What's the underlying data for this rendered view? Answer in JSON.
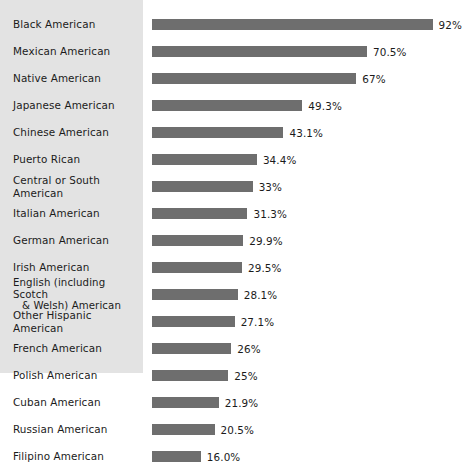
{
  "chart": {
    "type": "bar",
    "orientation": "horizontal",
    "title": "",
    "subtitle": "",
    "xlabel": "",
    "ylabel": "",
    "legend": "none",
    "grid": false,
    "axis_visible": false,
    "bar_color": "#6e6e6e",
    "label_panel_color": "#e3e3e3",
    "text_color": "#1b1b1b",
    "background_color": "#ffffff"
  },
  "chart_data": {
    "type": "bar",
    "orientation": "horizontal",
    "title": "",
    "subtitle": "",
    "xlabel": "",
    "ylabel": "",
    "xlim": [
      0,
      92
    ],
    "grid": false,
    "legend": "none",
    "value_unit": "%",
    "categories": [
      "Black American",
      "Mexican American",
      "Native American",
      "Japanese American",
      "Chinese American",
      "Puerto Rican",
      "Central or South American",
      "Italian American",
      "German American",
      "Irish American",
      "English (including Scotch & Welsh) American",
      "Other Hispanic American",
      "French American",
      "Polish American",
      "Cuban American",
      "Russian American",
      "Filipino American"
    ],
    "values": [
      92,
      70.5,
      67,
      49.3,
      43.1,
      34.4,
      33,
      31.3,
      29.9,
      29.5,
      28.1,
      27.1,
      26,
      25,
      21.9,
      20.5,
      16.0
    ],
    "value_labels": [
      "92%",
      "70.5%",
      "67%",
      "49.3%",
      "43.1%",
      "34.4%",
      "33%",
      "31.3%",
      "29.9%",
      "29.5%",
      "28.1%",
      "27.1%",
      "26%",
      "25%",
      "21.9%",
      "20.5%",
      "16.0%"
    ]
  },
  "rows": [
    {
      "label": "Black American",
      "label_line1": "Black American",
      "label_line2": "",
      "value": 92,
      "value_label": "92%"
    },
    {
      "label": "Mexican American",
      "label_line1": "Mexican American",
      "label_line2": "",
      "value": 70.5,
      "value_label": "70.5%"
    },
    {
      "label": "Native American",
      "label_line1": "Native American",
      "label_line2": "",
      "value": 67,
      "value_label": "67%"
    },
    {
      "label": "Japanese American",
      "label_line1": "Japanese American",
      "label_line2": "",
      "value": 49.3,
      "value_label": "49.3%"
    },
    {
      "label": "Chinese American",
      "label_line1": "Chinese American",
      "label_line2": "",
      "value": 43.1,
      "value_label": "43.1%"
    },
    {
      "label": "Puerto Rican",
      "label_line1": "Puerto Rican",
      "label_line2": "",
      "value": 34.4,
      "value_label": "34.4%"
    },
    {
      "label": "Central or South American",
      "label_line1": "Central or South American",
      "label_line2": "",
      "value": 33,
      "value_label": "33%"
    },
    {
      "label": "Italian American",
      "label_line1": "Italian American",
      "label_line2": "",
      "value": 31.3,
      "value_label": "31.3%"
    },
    {
      "label": "German American",
      "label_line1": "German American",
      "label_line2": "",
      "value": 29.9,
      "value_label": "29.9%"
    },
    {
      "label": "Irish American",
      "label_line1": "Irish American",
      "label_line2": "",
      "value": 29.5,
      "value_label": "29.5%"
    },
    {
      "label": "English (including Scotch & Welsh) American",
      "label_line1": "English (including Scotch",
      "label_line2": "& Welsh) American",
      "value": 28.1,
      "value_label": "28.1%"
    },
    {
      "label": "Other Hispanic American",
      "label_line1": "Other Hispanic American",
      "label_line2": "",
      "value": 27.1,
      "value_label": "27.1%"
    },
    {
      "label": "French American",
      "label_line1": "French American",
      "label_line2": "",
      "value": 26,
      "value_label": "26%"
    },
    {
      "label": "Polish American",
      "label_line1": "Polish American",
      "label_line2": "",
      "value": 25,
      "value_label": "25%"
    },
    {
      "label": "Cuban American",
      "label_line1": "Cuban American",
      "label_line2": "",
      "value": 21.9,
      "value_label": "21.9%"
    },
    {
      "label": "Russian American",
      "label_line1": "Russian American",
      "label_line2": "",
      "value": 20.5,
      "value_label": "20.5%"
    },
    {
      "label": "Filipino American",
      "label_line1": "Filipino American",
      "label_line2": "",
      "value": 16.0,
      "value_label": "16.0%"
    }
  ],
  "layout": {
    "row_height": 27,
    "first_row_top": 11,
    "bar_left": 152,
    "px_per_percent": 3.05,
    "bar_height": 11,
    "value_gap": 6
  }
}
